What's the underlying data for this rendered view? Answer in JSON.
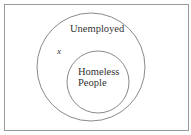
{
  "diagram": {
    "type": "venn",
    "sets": [
      {
        "name": "outer",
        "label": "Unemployed"
      },
      {
        "name": "inner",
        "label_line1": "Homeless",
        "label_line2": "People"
      }
    ],
    "point_label": "x",
    "colors": {
      "stroke": "#8a8a8a",
      "text": "#333333",
      "background": "#ffffff"
    }
  }
}
